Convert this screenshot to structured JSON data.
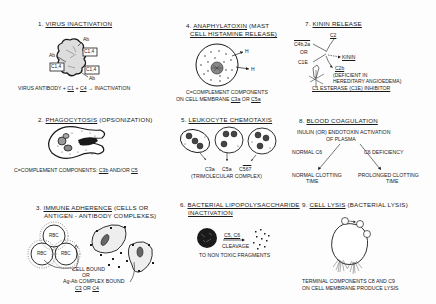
{
  "figure": {
    "panels": [
      {
        "id": 1,
        "number": "1.",
        "title": "VIRUS INACTIVATION",
        "labels": {
          "ab": "Ab",
          "c14": "C1,4"
        },
        "caption": {
          "prefix": "VIRUS ANTIBODY + ",
          "c1": "C1",
          "plus": " + ",
          "c4": "C4",
          "suffix": " → INACTIVATION"
        }
      },
      {
        "id": 2,
        "number": "2.",
        "title": "PHAGOCYTOSIS",
        "title_paren": "(OPSONIZATION)",
        "caption": {
          "prefix": "C=COMPLEMENT COMPONENTS: ",
          "c3b": "C3b",
          "mid": " AND/OR ",
          "c5": "C5"
        }
      },
      {
        "id": 3,
        "number": "3.",
        "title": "IMMUNE ADHERENCE",
        "title_paren": "(CELLS OR",
        "title_line2": "ANTIGEN - ANTIBODY COMPLEXES)",
        "labels": {
          "rbc": "RBC",
          "cell_bound": "CELL BOUND",
          "or": "OR",
          "complex_bound": "Ag-Ab COMPLEX BOUND",
          "c3": "C3",
          "or2": " OR ",
          "c4": "C4"
        }
      },
      {
        "id": 4,
        "number": "4.",
        "title": "ANAPHYLATOXIN",
        "title_paren": "(MAST",
        "title_line2": "CELL HISTAMINE RELEASE)",
        "labels": {
          "h": "H",
          "c": "C"
        },
        "caption_line1": "C=COMPLEMENT COMPONENTS",
        "caption_line2": {
          "prefix": "ON CELL MEMBRANE ",
          "c3a": "C3a",
          "mid": " OR ",
          "c5a": "C5a"
        }
      },
      {
        "id": 5,
        "number": "5.",
        "title": "LEUKOCYTE CHEMOTAXIS",
        "labels": {
          "c3a": "C3a",
          "c5a": "C5a",
          "c567_prefix": "C",
          "c567": "567"
        },
        "caption": "(TRIMOLECULAR COMPLEX)"
      },
      {
        "id": 6,
        "number": "6.",
        "title": "BACTERIAL LIPOPOLYSACCHARIDE",
        "title_line2": "INACTIVATION",
        "labels": {
          "c5c6": "C5, C6",
          "cleavage": "CLEAVAGE"
        },
        "caption": "TO NON TOXIC FRAGMENTS"
      },
      {
        "id": 7,
        "number": "7.",
        "title": "KININ RELEASE",
        "labels": {
          "c2": "C2",
          "c4b2a": "C4b,2a",
          "or": "OR",
          "c1e": "C1E",
          "kinin": "KININ",
          "c2b": "C2b",
          "deficient_line1": "(DEFICIENT IN",
          "deficient_line2": "HEREDITARY ANGIOEDEMA)"
        },
        "caption": "C1 ESTERASE (C1E) INHIBITOR"
      },
      {
        "id": 8,
        "number": "8.",
        "title": "BLOOD COAGULATION",
        "subtitle_line1": "INULIN (OR) ENDOTOXIN ACTIVATION",
        "subtitle_line2": "OF PLASMA",
        "labels": {
          "normal_c6": "NORMAL C6",
          "c6_deficiency": "C6 DEFICIENCY",
          "normal_line1": "NORMAL CLOTTING",
          "normal_line2": "TIME",
          "prolonged_line1": "PROLONGED CLOTTING",
          "prolonged_line2": "TIME"
        }
      },
      {
        "id": 9,
        "number": "9.",
        "title": "CELL LYSIS",
        "title_paren": "(BACTERIAL LYSIS)",
        "caption_line1": "TERMINAL COMPONENTS C8 AND C9",
        "caption_line2": "ON CELL MEMBRANE PRODUCE LYSIS"
      }
    ],
    "colors": {
      "ink": "#1a1a1a",
      "paper": "#fdfdfd"
    }
  }
}
